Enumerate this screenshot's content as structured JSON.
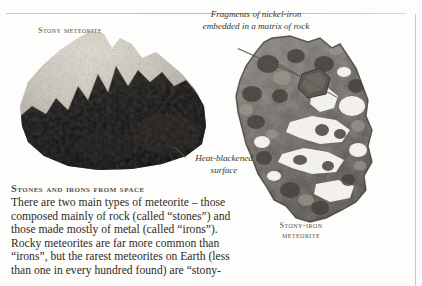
{
  "page": {
    "background_color": "#fdfdfc",
    "rule_color": "#c9c9c4"
  },
  "labels": {
    "stony_meteorite": "Stony meteorite",
    "stony_iron_meteorite": "Stony-iron meteorite"
  },
  "captions": {
    "fragments": "Fragments of nickel-iron embedded in a matrix of rock",
    "heat_blackened": "Heat-blackened surface"
  },
  "article": {
    "heading": "Stones and irons from space",
    "body": "There are two main types of meteorite – those composed mainly of rock (called “stones”) and those made mostly of metal (called “irons”). Rocky meteorites are far more common than “irons”, but the rarest meteorites on Earth (less than one in every hundred found) are “stony-"
  },
  "specimens": {
    "stony": {
      "name": "stony-meteorite-photo",
      "crust_color": "#d8d3c6",
      "fusion_crust_color": "#14120f"
    },
    "stony_iron": {
      "name": "stony-iron-meteorite-photo",
      "matrix_color": "#6f6a63",
      "inclusion_color": "#f6f4ef"
    }
  }
}
